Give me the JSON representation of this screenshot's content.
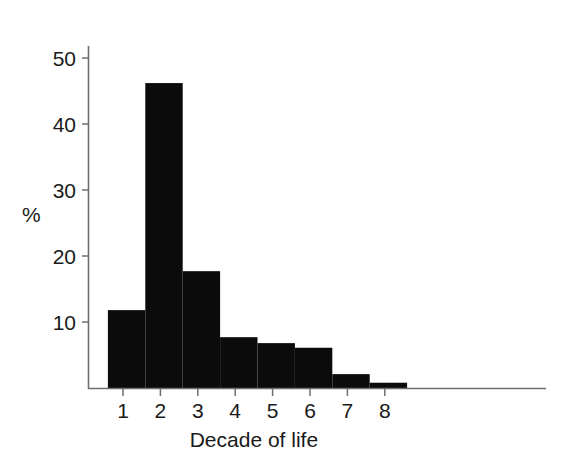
{
  "chart_data": {
    "type": "bar",
    "title": "",
    "subtitle": "",
    "xlabel": "Decade of life",
    "ylabel": "%",
    "categories": [
      "1",
      "2",
      "3",
      "4",
      "5",
      "6",
      "7",
      "8"
    ],
    "values": [
      11.8,
      46.2,
      17.7,
      7.7,
      6.8,
      6.1,
      2.1,
      0.8
    ],
    "series": [
      {
        "name": "Percent of cases",
        "values": [
          11.8,
          46.2,
          17.7,
          7.7,
          6.8,
          6.1,
          2.1,
          0.8
        ]
      }
    ],
    "xtick_labels": [
      "1",
      "2",
      "3",
      "4",
      "5",
      "6",
      "7",
      "8"
    ],
    "ytick_labels": [
      "10",
      "20",
      "30",
      "40",
      "50"
    ],
    "ytick_values": [
      10,
      20,
      30,
      40,
      50
    ],
    "ylim": [
      0,
      55
    ],
    "xlim": [
      0.5,
      12.0
    ],
    "grid": false,
    "legend": false,
    "legend_position": "none",
    "bar_color": "#0b0b0b",
    "axis_color": "#6e6e6e",
    "text_color": "#1a1a1a",
    "annotations": []
  },
  "axes": {
    "y_axis_title": "%",
    "x_axis_title": "Decade of life"
  }
}
